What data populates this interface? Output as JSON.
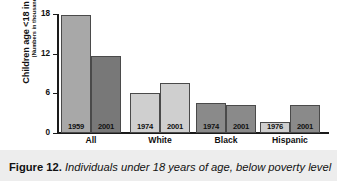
{
  "figure": {
    "caption_label": "Figure 12.",
    "caption_text": " Individuals under 18 years of age, below poverty level"
  },
  "axis": {
    "y_title_line1": "Children age <18 in poverty",
    "y_title_line2": "(Numbers in thousands)",
    "y_ticks": [
      "18",
      "12",
      "6",
      "0"
    ]
  },
  "colors": {
    "bar_light": "#cfcfcf",
    "bar_medium": "#a8a8a8",
    "bar_dark": "#8a8a8a",
    "bar_darkest": "#787878",
    "axis": "#1a1a1a",
    "caption_band": "#ededed"
  },
  "chart_data": {
    "type": "bar",
    "title": "Individuals under 18 years of age, below poverty level",
    "xlabel": "",
    "ylabel": "Children age <18 in poverty (Numbers in thousands)",
    "ylim": [
      0,
      18
    ],
    "yticks": [
      0,
      6,
      12,
      18
    ],
    "grid": false,
    "legend": "none",
    "groups": [
      "All",
      "White",
      "Black",
      "Hispanic"
    ],
    "bars": [
      {
        "group": "All",
        "year": "1959",
        "value": 17.8,
        "shade": "medium"
      },
      {
        "group": "All",
        "year": "2001",
        "value": 11.7,
        "shade": "darkest"
      },
      {
        "group": "White",
        "year": "1974",
        "value": 6.1,
        "shade": "light"
      },
      {
        "group": "White",
        "year": "2001",
        "value": 7.5,
        "shade": "light"
      },
      {
        "group": "Black",
        "year": "1974",
        "value": 4.5,
        "shade": "dark"
      },
      {
        "group": "Black",
        "year": "2001",
        "value": 4.2,
        "shade": "dark"
      },
      {
        "group": "Hispanic",
        "year": "1976",
        "value": 1.6,
        "shade": "light"
      },
      {
        "group": "Hispanic",
        "year": "2001",
        "value": 4.2,
        "shade": "dark"
      }
    ]
  }
}
